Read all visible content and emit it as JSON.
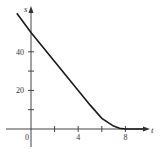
{
  "chart_data": {
    "type": "line",
    "title": "",
    "xlabel": "t",
    "ylabel": "s",
    "xlim": [
      -2.5,
      10
    ],
    "ylim": [
      -10,
      62
    ],
    "x_ticks": [
      2,
      4,
      6,
      8
    ],
    "x_tick_labels": {
      "4": "4",
      "8": "8"
    },
    "y_ticks": [
      10,
      20,
      30,
      40
    ],
    "y_tick_labels": {
      "20": "20",
      "40": "40"
    },
    "origin_label": "0",
    "grid": false,
    "legend": null,
    "series": [
      {
        "name": "s(t)",
        "x": [
          -1.2,
          0,
          1,
          2,
          3,
          4,
          5,
          6,
          7,
          7.5,
          8,
          9.5
        ],
        "values": [
          60,
          50,
          42.5,
          35,
          27.5,
          20,
          12.5,
          5.5,
          1.5,
          0.4,
          0,
          0
        ]
      }
    ],
    "colors": {
      "line": "#1a1a1a",
      "axis": "#444444"
    }
  }
}
